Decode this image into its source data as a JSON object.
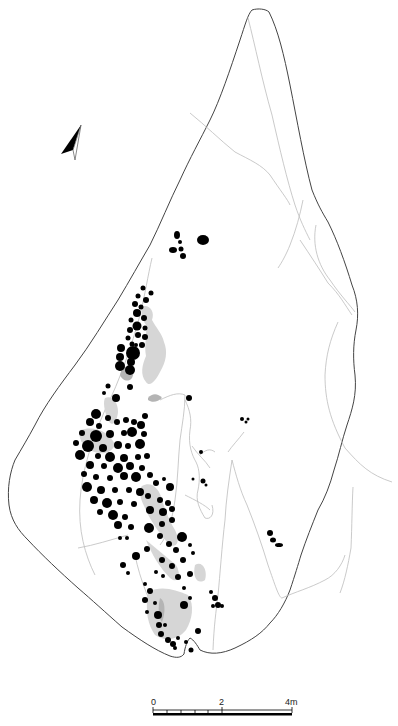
{
  "figure": {
    "type": "archaeological site plan",
    "colors": {
      "outline": "#444444",
      "inner_lines": "#b8b8b8",
      "features_dark": "#000000",
      "features_grey_light": "#d6d6d6",
      "features_grey_mid": "#b4b4b4"
    }
  },
  "north_arrow": {
    "icon": "north-arrow-icon"
  },
  "scale_bar": {
    "labels": [
      "0",
      "2",
      "4m"
    ],
    "unit": "m",
    "min": 0,
    "mid": 2,
    "max": 4
  }
}
